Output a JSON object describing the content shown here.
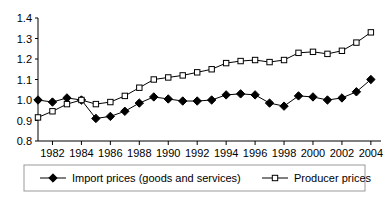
{
  "chart_data": {
    "type": "line",
    "title": "",
    "subtitle": "",
    "xlabel": "",
    "ylabel": "",
    "xlim": [
      1981,
      2004.7
    ],
    "ylim": [
      0.8,
      1.4
    ],
    "yticks": [
      "0.8",
      "0.9",
      "1.0",
      "1.1",
      "1.2",
      "1.3",
      "1.4"
    ],
    "ytick_values": [
      0.8,
      0.9,
      1.0,
      1.1,
      1.2,
      1.3,
      1.4
    ],
    "xticks": [
      "1982",
      "1984",
      "1986",
      "1988",
      "1990",
      "1992",
      "1994",
      "1996",
      "1998",
      "2000",
      "2002",
      "2004"
    ],
    "xtick_values": [
      1982,
      1984,
      1986,
      1988,
      1990,
      1992,
      1994,
      1996,
      1998,
      2000,
      2002,
      2004
    ],
    "x": [
      1981,
      1982,
      1983,
      1984,
      1985,
      1986,
      1987,
      1988,
      1989,
      1990,
      1991,
      1992,
      1993,
      1994,
      1995,
      1996,
      1997,
      1998,
      1999,
      2000,
      2001,
      2002,
      2003,
      2004
    ],
    "grid": false,
    "legend_position": "bottom",
    "series": [
      {
        "name": "Import prices (goods and services)",
        "marker": "filled-diamond",
        "color": "#000000",
        "values": [
          1.0,
          0.99,
          1.01,
          1.0,
          0.91,
          0.92,
          0.945,
          0.985,
          1.015,
          1.005,
          0.995,
          0.995,
          1.0,
          1.025,
          1.03,
          1.025,
          0.985,
          0.97,
          1.02,
          1.015,
          1.0,
          1.01,
          1.04,
          1.1
        ]
      },
      {
        "name": "Producer prices",
        "marker": "open-square",
        "color": "#000000",
        "values": [
          0.915,
          0.945,
          0.98,
          1.0,
          0.98,
          0.99,
          1.02,
          1.06,
          1.1,
          1.11,
          1.12,
          1.135,
          1.15,
          1.18,
          1.19,
          1.195,
          1.185,
          1.195,
          1.23,
          1.235,
          1.225,
          1.24,
          1.28,
          1.33
        ]
      }
    ]
  },
  "legend": {
    "items": [
      {
        "label": "Import prices (goods and services)",
        "marker": "filled-diamond"
      },
      {
        "label": "Producer prices",
        "marker": "open-square"
      }
    ]
  }
}
